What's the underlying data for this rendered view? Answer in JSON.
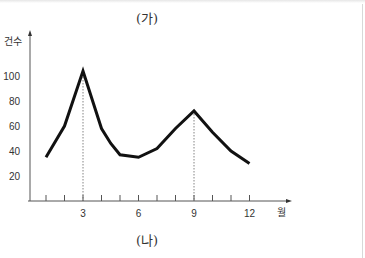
{
  "chart_data": {
    "type": "line",
    "title": "(가)",
    "caption": "(나)",
    "xlabel": "월",
    "ylabel": "건수",
    "x": [
      1,
      2,
      3,
      4,
      4.5,
      5,
      6,
      7,
      8,
      9,
      10,
      11,
      12
    ],
    "values": [
      35,
      60,
      104,
      58,
      46,
      37,
      35,
      42,
      58,
      72,
      55,
      40,
      30
    ],
    "x_ticks": [
      3,
      6,
      9,
      12
    ],
    "x_minor_ticks": [
      1,
      2,
      3,
      4,
      5,
      6,
      7,
      8,
      9,
      10,
      11,
      12
    ],
    "y_ticks": [
      20,
      40,
      60,
      80,
      100
    ],
    "xlim": [
      0,
      14
    ],
    "ylim": [
      0,
      120
    ],
    "grid": false,
    "annotations": [
      {
        "type": "dotted-vline",
        "x": 3,
        "y": 104
      },
      {
        "type": "dotted-vline",
        "x": 9,
        "y": 72
      }
    ],
    "line_color": "#111111"
  }
}
